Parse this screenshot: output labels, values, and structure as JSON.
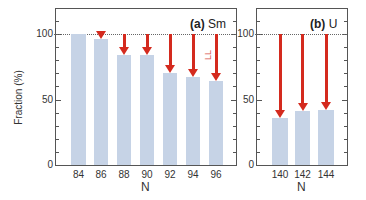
{
  "chart_data": [
    {
      "type": "bar",
      "panel": "(a)",
      "title_bold": "(a)",
      "title": "Sm",
      "categories": [
        "84",
        "86",
        "88",
        "90",
        "92",
        "94",
        "96"
      ],
      "values": [
        100,
        96,
        84,
        84,
        70,
        67,
        64
      ],
      "reference_line": 100,
      "arrows_from": 100,
      "ylabel": "Fraction (%)",
      "xlabel": "N",
      "ylim": [
        0,
        120
      ],
      "yticks": [
        0,
        50,
        100
      ],
      "annotations": [
        "2+1 exc. energy (w/ LL)",
        "LL"
      ]
    },
    {
      "type": "bar",
      "panel": "(b)",
      "title_bold": "(b)",
      "title": "U",
      "categories": [
        "140",
        "142",
        "144"
      ],
      "values": [
        36,
        41,
        42
      ],
      "reference_line": 100,
      "arrows_from": 100,
      "xlabel": "N",
      "ylim": [
        0,
        120
      ],
      "yticks": [
        0,
        50,
        100
      ]
    }
  ],
  "labels": {
    "ylabel": "Fraction (%)",
    "xlabel_a": "N",
    "xlabel_b": "N",
    "bar_annotation": "2⁺₁ exc. energy (w/ LL)",
    "ll_annotation": "LL",
    "panel_a_bold": "(a)",
    "panel_a_name": "Sm",
    "panel_b_bold": "(b)",
    "panel_b_name": "U",
    "ytick_0": "0",
    "ytick_50": "50",
    "ytick_100": "100"
  },
  "colors": {
    "bar": "#c6d3e6",
    "arrow": "#d42a1e",
    "ll_text": "#d9534f"
  }
}
